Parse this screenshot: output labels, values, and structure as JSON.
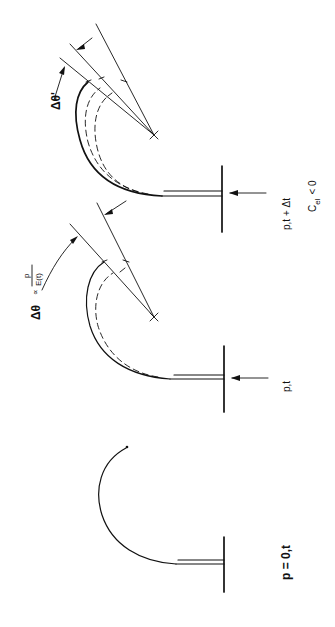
{
  "diagram": {
    "type": "bourdon-tube-deflection",
    "orientation": "rotated-90-ccw",
    "stages": [
      {
        "id": "stage-1",
        "label": "p = 0,t"
      },
      {
        "id": "stage-2",
        "label": "p,t",
        "annotation": {
          "delta": "Δθ",
          "proportional": "∝",
          "numerator": "p",
          "denominator": "E(t)"
        }
      },
      {
        "id": "stage-3",
        "label_line1": "p,t + Δt",
        "label_line2_main": "C",
        "label_line2_sub": "el",
        "label_line2_rest": "< 0",
        "annotation": {
          "delta": "Δθ'"
        }
      }
    ],
    "colors": {
      "ink": "#111111",
      "background": "#ffffff"
    }
  }
}
